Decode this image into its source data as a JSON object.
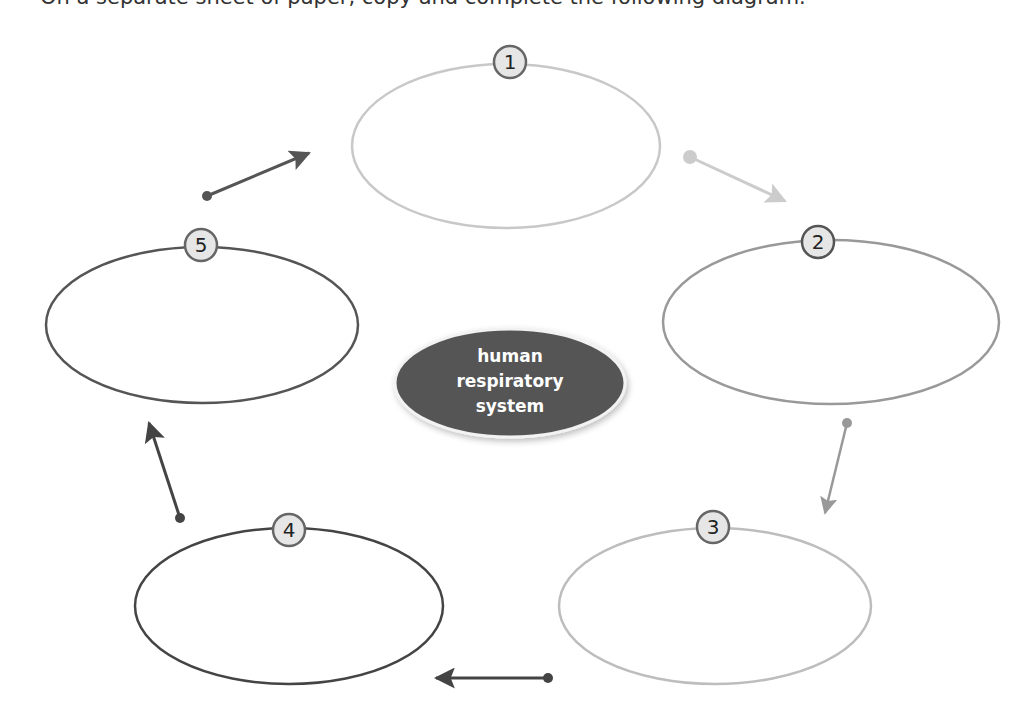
{
  "instruction": {
    "text": "On a separate sheet of paper, copy and complete the following diagram."
  },
  "center": {
    "lines": [
      "human",
      "respiratory",
      "system"
    ],
    "fill": "#555555"
  },
  "nodes": [
    {
      "number": "1",
      "stroke": "#c8c8c8",
      "cx": 506,
      "cy": 146,
      "rx": 154,
      "ry": 82
    },
    {
      "number": "2",
      "stroke": "#999999",
      "cx": 831,
      "cy": 322,
      "rx": 168,
      "ry": 82
    },
    {
      "number": "3",
      "stroke": "#bdbdbd",
      "cx": 715,
      "cy": 606,
      "rx": 156,
      "ry": 78
    },
    {
      "number": "4",
      "stroke": "#444444",
      "cx": 289,
      "cy": 606,
      "rx": 154,
      "ry": 78
    },
    {
      "number": "5",
      "stroke": "#555555",
      "cx": 202,
      "cy": 325,
      "rx": 156,
      "ry": 78
    }
  ],
  "arrows": [
    {
      "from": "5",
      "to": "1",
      "color": "#555555"
    },
    {
      "from": "1",
      "to": "2",
      "color": "#cccccc"
    },
    {
      "from": "2",
      "to": "3",
      "color": "#999999"
    },
    {
      "from": "3",
      "to": "4",
      "color": "#444444"
    },
    {
      "from": "4",
      "to": "5",
      "color": "#444444"
    }
  ]
}
